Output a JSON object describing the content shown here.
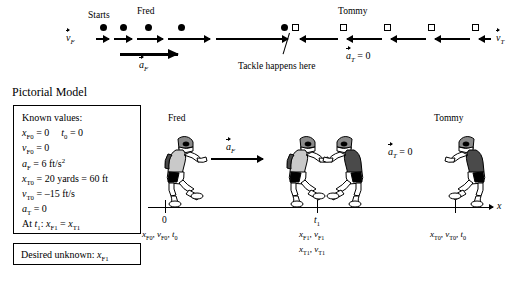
{
  "figure": {
    "section_title": "Pictorial Model"
  },
  "motion_diagram": {
    "label_starts": "Starts",
    "label_fred": "Fred",
    "label_tommy": "Tommy",
    "label_tackle": "Tackle happens here",
    "vec_vF_symbol": "v",
    "vec_vF_sub": "F",
    "vec_aF_symbol": "a",
    "vec_aF_sub": "F",
    "vec_vT_symbol": "v",
    "vec_vT_sub": "T",
    "vec_aT_symbol": "a",
    "vec_aT_sub": "T",
    "vec_aT_value": " = 0",
    "fred_dot_positions": [
      100,
      120,
      145,
      178,
      281
    ],
    "tommy_square_positions": [
      292,
      340,
      384,
      428,
      472
    ]
  },
  "known_values": {
    "heading": "Known values:",
    "lines": [
      "x_F0 = 0    t_0 = 0",
      "v_F0 = 0",
      "a_F  = 6 ft/s^2",
      "x_T0 = 20 yards = 60 ft",
      "v_T0 = -15 ft/s",
      "a_T  = 0",
      "At t_1:  x_F1 = x_T1"
    ],
    "row1_a": "x",
    "row1_a_sub": "F0",
    "row1_a_val": " = 0",
    "row1_b": "t",
    "row1_b_sub": "0",
    "row1_b_val": " = 0",
    "row2": "v",
    "row2_sub": "F0",
    "row2_val": " = 0",
    "row3": "a",
    "row3_sub": "F",
    "row3_val": " = 6 ft/s",
    "row3_exp": "2",
    "row4": "x",
    "row4_sub": "T0",
    "row4_val": " = 20 yards = 60 ft",
    "row5": "v",
    "row5_sub": "T0",
    "row5_val": " = –15 ft/s",
    "row6": "a",
    "row6_sub": "T",
    "row6_val": " = 0",
    "row7_pre": "At ",
    "row7_t": "t",
    "row7_t_sub": "1",
    "row7_colon": ":  ",
    "row7_x1": "x",
    "row7_x1_sub": "F1",
    "row7_eq": " = ",
    "row7_x2": "x",
    "row7_x2_sub": "T1"
  },
  "desired_unknown": {
    "prefix": "Desired unknown: ",
    "symbol": "x",
    "symbol_sub": "F1"
  },
  "pictorial": {
    "label_fred": "Fred",
    "label_tommy": "Tommy",
    "vec_aF_symbol": "a",
    "vec_aF_sub": "F",
    "vec_aT_symbol": "a",
    "vec_aT_sub": "T",
    "vec_aT_value": " = 0",
    "axis_label": "x",
    "ticks": [
      {
        "top": "0",
        "vars": [
          "x_F0",
          "v_F0",
          "t_0"
        ]
      },
      {
        "top": "t_1",
        "vars": [
          "x_F1",
          "v_F1",
          "x_T1",
          "v_T1"
        ]
      },
      {
        "top": "",
        "vars": [
          "x_T0",
          "v_T0",
          "t_0"
        ]
      }
    ],
    "tick0_top": "0",
    "tick0_x": "x",
    "tick0_x_sub": "F0",
    "tick0_v": "v",
    "tick0_v_sub": "F0",
    "tick0_t": "t",
    "tick0_t_sub": "0",
    "tick1_top_t": "t",
    "tick1_top_sub": "1",
    "tick1_x": "x",
    "tick1_x_sub": "F1",
    "tick1_v": "v",
    "tick1_v_sub": "F1",
    "tick1_x2": "x",
    "tick1_x2_sub": "T1",
    "tick1_v2": "v",
    "tick1_v2_sub": "T1",
    "tick2_x": "x",
    "tick2_x_sub": "T0",
    "tick2_v": "v",
    "tick2_v_sub": "T0",
    "tick2_t": "t",
    "tick2_t_sub": "0"
  },
  "colors": {
    "ink": "#000000",
    "jersey_light": "#c9c9c9",
    "jersey_dark": "#4a4a4a",
    "helmet": "#8a8a8a",
    "paper": "#ffffff"
  }
}
